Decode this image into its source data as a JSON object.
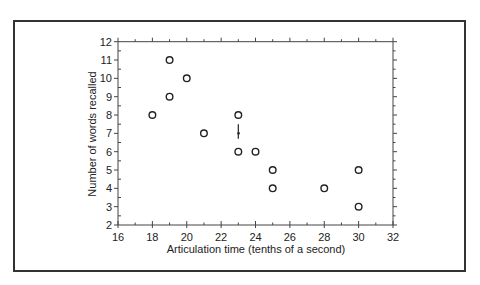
{
  "chart_data": {
    "type": "scatter",
    "title": "",
    "xlabel": "Articulation time (tenths of a second)",
    "ylabel": "Number of words recalled",
    "xlim": [
      16,
      32
    ],
    "ylim": [
      2,
      12
    ],
    "x_ticks": [
      16,
      18,
      20,
      22,
      24,
      26,
      28,
      30,
      32
    ],
    "y_ticks": [
      2,
      3,
      4,
      5,
      6,
      7,
      8,
      9,
      10,
      11,
      12
    ],
    "grid": false,
    "legend": null,
    "marker": "open-circle",
    "points": [
      {
        "x": 18,
        "y": 8
      },
      {
        "x": 19,
        "y": 11
      },
      {
        "x": 19,
        "y": 9
      },
      {
        "x": 20,
        "y": 10
      },
      {
        "x": 21,
        "y": 7
      },
      {
        "x": 23,
        "y": 8
      },
      {
        "x": 23,
        "y": 6
      },
      {
        "x": 24,
        "y": 6
      },
      {
        "x": 25,
        "y": 5
      },
      {
        "x": 25,
        "y": 4
      },
      {
        "x": 28,
        "y": 4
      },
      {
        "x": 30,
        "y": 5
      },
      {
        "x": 30,
        "y": 3
      }
    ],
    "annotations": [
      {
        "type": "mean-marker",
        "x": 23,
        "y": 7,
        "y_low": 6.7,
        "y_high": 7.5
      }
    ]
  },
  "colors": {
    "frame": "#333333",
    "axis": "#444444",
    "marker": "#222222",
    "text": "#222222",
    "background": "#ffffff"
  }
}
